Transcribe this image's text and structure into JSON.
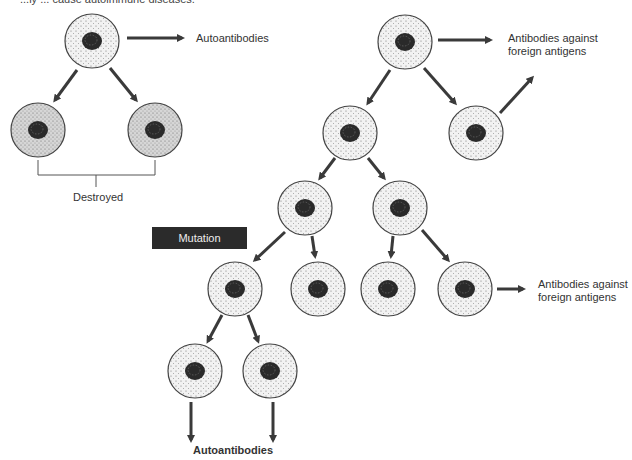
{
  "caption": "...ly ... cause autoimmune diseases.",
  "labels": {
    "autoantibodies_top": "Autoantibodies",
    "destroyed": "Destroyed",
    "antibodies_top": "Antibodies against foreign antigens",
    "antibodies_top_l1": "Antibodies against",
    "antibodies_top_l2": "foreign antigens",
    "antibodies_mid_l1": "Antibodies against",
    "antibodies_mid_l2": "foreign antigens",
    "mutation": "Mutation",
    "autoantibodies_bottom": "Autoantibodies"
  },
  "colors": {
    "normal_cell_fill": "#f2f2f2",
    "destroyed_cell_fill": "#d6d6d6",
    "nucleus": "#2a2a2a",
    "arrow": "#3a3a3a",
    "mutation_box": "#2b2b2b"
  },
  "cells": [
    {
      "id": "left-parent",
      "cx": 92,
      "cy": 41,
      "type": "normal"
    },
    {
      "id": "destroyed-left",
      "cx": 38,
      "cy": 130,
      "type": "destroyed"
    },
    {
      "id": "destroyed-right",
      "cx": 155,
      "cy": 130,
      "type": "destroyed"
    },
    {
      "id": "right-parent",
      "cx": 405,
      "cy": 42,
      "type": "normal"
    },
    {
      "id": "gen2-left",
      "cx": 350,
      "cy": 133,
      "type": "normal"
    },
    {
      "id": "gen2-right",
      "cx": 476,
      "cy": 133,
      "type": "normal"
    },
    {
      "id": "gen3-left",
      "cx": 305,
      "cy": 208,
      "type": "normal"
    },
    {
      "id": "gen3-right",
      "cx": 400,
      "cy": 208,
      "type": "normal"
    },
    {
      "id": "gen4-mutant",
      "cx": 235,
      "cy": 289,
      "type": "normal"
    },
    {
      "id": "gen4-b",
      "cx": 318,
      "cy": 289,
      "type": "normal"
    },
    {
      "id": "gen4-c",
      "cx": 388,
      "cy": 289,
      "type": "normal"
    },
    {
      "id": "gen4-d",
      "cx": 465,
      "cy": 289,
      "type": "normal"
    },
    {
      "id": "gen5-left",
      "cx": 195,
      "cy": 371,
      "type": "normal"
    },
    {
      "id": "gen5-right",
      "cx": 270,
      "cy": 371,
      "type": "normal"
    }
  ]
}
